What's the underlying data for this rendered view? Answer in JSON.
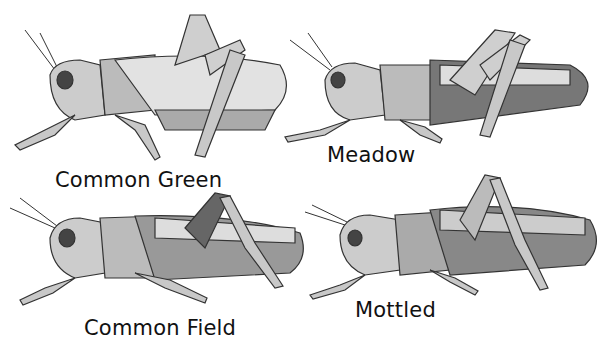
{
  "figure": {
    "panels": [
      {
        "id": "common-green",
        "label": "Common Green"
      },
      {
        "id": "meadow",
        "label": "Meadow"
      },
      {
        "id": "common-field",
        "label": "Common Field"
      },
      {
        "id": "mottled",
        "label": "Mottled"
      }
    ]
  }
}
